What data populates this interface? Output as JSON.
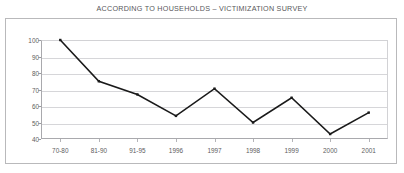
{
  "chart_data": {
    "type": "line",
    "title": "ACCORDING TO HOUSEHOLDS – VICTIMIZATION SURVEY",
    "xlabel": "",
    "ylabel": "",
    "categories": [
      "70-80",
      "81-90",
      "91-95",
      "1996",
      "1997",
      "1998",
      "1999",
      "2000",
      "2001"
    ],
    "values": [
      100,
      75,
      67,
      54,
      70.5,
      50,
      65,
      43,
      56
    ],
    "series": [
      {
        "name": "Victimization",
        "values": [
          100,
          75,
          67,
          54,
          70.5,
          50,
          65,
          43,
          56
        ]
      }
    ],
    "ylim": [
      40,
      100
    ],
    "yticks": [
      40,
      50,
      60,
      70,
      80,
      90,
      100
    ],
    "ytick_labels": [
      "40",
      "50",
      "60",
      "70",
      "80",
      "90",
      "100"
    ],
    "grid": true,
    "grid_axis": "y",
    "legend": false,
    "legend_position": "none",
    "markers": true,
    "line_color": "#1a1a1a",
    "grid_color": "#d6d6d9",
    "axis_color": "#a9a9ad",
    "text_color": "#5d5d60",
    "title_color": "#57575a",
    "background_color": "#ffffff",
    "frame_color": "#b9b9bb"
  }
}
